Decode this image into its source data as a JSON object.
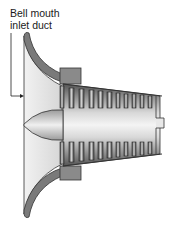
{
  "diagram": {
    "title": "Bell mouth inlet duct",
    "label_lines": [
      "Bell mouth",
      "inlet duct"
    ],
    "components": [
      {
        "id": "bell-mouth",
        "name": "Bell mouth inlet duct",
        "color": "#7a7a7a"
      },
      {
        "id": "inlet-cavity",
        "name": "Inlet airflow region",
        "color": "#e6e6e6"
      },
      {
        "id": "spinner",
        "name": "Nose cone / spinner",
        "color": "#9a9a9a"
      },
      {
        "id": "flange",
        "name": "Mounting flange",
        "color": "#8a8a8a"
      },
      {
        "id": "compressor",
        "name": "Axial compressor stages",
        "color": "#6f6f6f",
        "stages": 10
      },
      {
        "id": "shaft",
        "name": "Shaft end",
        "color": "#cfcfcf"
      }
    ],
    "leader_arrow": {
      "from": "label",
      "to": "bell-mouth"
    }
  }
}
